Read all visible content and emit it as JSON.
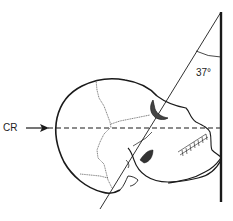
{
  "diagram": {
    "type": "radiographic-positioning",
    "labels": {
      "central_ray": "CR",
      "angle": "37°"
    },
    "colors": {
      "line": "#1a1a1a",
      "background": "#ffffff"
    },
    "elements": [
      {
        "name": "image-receptor",
        "shape": "vertical-line"
      },
      {
        "name": "central-ray",
        "shape": "dashed-horizontal-line",
        "arrow": true
      },
      {
        "name": "reference-line",
        "shape": "oblique-line"
      },
      {
        "name": "skull",
        "shape": "lateral-skull-outline"
      }
    ]
  }
}
